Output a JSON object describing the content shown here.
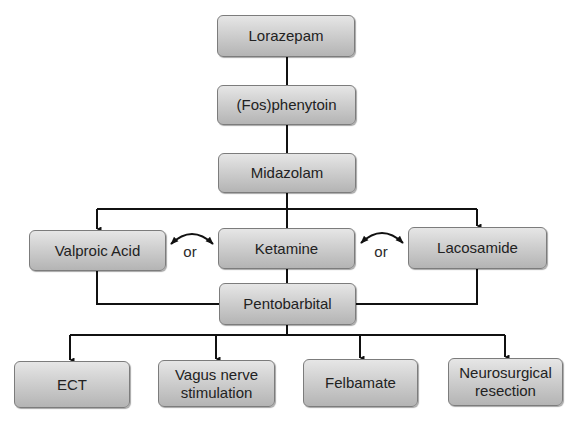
{
  "diagram": {
    "type": "flowchart",
    "nodes": {
      "lorazepam": {
        "label": "Lorazepam"
      },
      "fosphenytoin": {
        "label": "(Fos)phenytoin"
      },
      "midazolam": {
        "label": "Midazolam"
      },
      "valproic_acid": {
        "label": "Valproic Acid"
      },
      "ketamine": {
        "label": "Ketamine"
      },
      "lacosamide": {
        "label": "Lacosamide"
      },
      "pentobarbital": {
        "label": "Pentobarbital"
      },
      "ect": {
        "label": "ECT"
      },
      "vns": {
        "line1": "Vagus nerve",
        "line2": "stimulation"
      },
      "felbamate": {
        "label": "Felbamate"
      },
      "neurosurgical": {
        "line1": "Neurosurgical",
        "line2": "resection"
      }
    },
    "alternatives": [
      {
        "label": "or",
        "between": [
          "Valproic Acid",
          "Ketamine"
        ]
      },
      {
        "label": "or",
        "between": [
          "Ketamine",
          "Lacosamide"
        ]
      }
    ],
    "edges": [
      [
        "Lorazepam",
        "(Fos)phenytoin"
      ],
      [
        "(Fos)phenytoin",
        "Midazolam"
      ],
      [
        "Midazolam",
        "Valproic Acid"
      ],
      [
        "Midazolam",
        "Ketamine"
      ],
      [
        "Midazolam",
        "Lacosamide"
      ],
      [
        "Valproic Acid",
        "Pentobarbital"
      ],
      [
        "Ketamine",
        "Pentobarbital"
      ],
      [
        "Lacosamide",
        "Pentobarbital"
      ],
      [
        "Pentobarbital",
        "ECT"
      ],
      [
        "Pentobarbital",
        "Vagus nerve stimulation"
      ],
      [
        "Pentobarbital",
        "Felbamate"
      ],
      [
        "Pentobarbital",
        "Neurosurgical resection"
      ]
    ],
    "colors": {
      "node_fill_top": "#e6e6e6",
      "node_fill_bottom": "#b4b4b4",
      "node_border": "#7c7c7c",
      "line": "#111111",
      "text": "#222222"
    }
  }
}
